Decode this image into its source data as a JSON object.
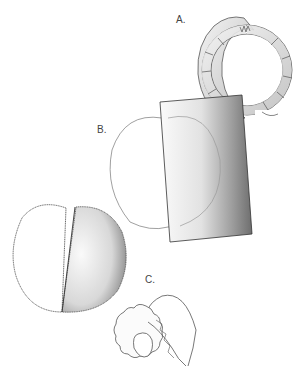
{
  "figure": {
    "labels": {
      "a": "A.",
      "b": "B.",
      "c": "C."
    },
    "panels": [
      {
        "id": "A",
        "description": "ring-shaped cross-section with segmented wall"
      },
      {
        "id": "B",
        "description": "cylindrical shaded block overlapping outlined oval"
      },
      {
        "id": "C",
        "description": "lobed organ with curved appendage"
      }
    ],
    "extra_figure": {
      "description": "two-lobed body, left half outlined, right half shaded"
    },
    "colors": {
      "line": "#555555",
      "shade_dark": "#6e6e6e",
      "shade_light": "#f2f2f2",
      "background": "#ffffff"
    }
  }
}
